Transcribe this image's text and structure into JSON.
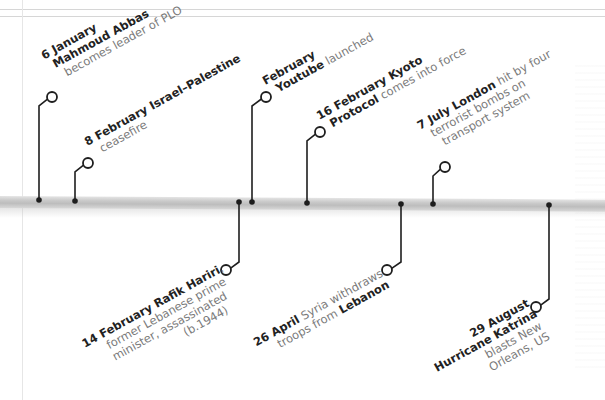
{
  "colors": {
    "pin": "#1e1e1e",
    "bold_text": "#222222",
    "light_text": "#7a7a7a",
    "bar": "#c4c4c4",
    "frame": "#d6d6d6"
  },
  "events_above": [
    {
      "id": "6-january",
      "date": "6 January",
      "lines": [
        {
          "bold": "6 January",
          "text": ""
        },
        {
          "bold": "Mahmoud Abbas",
          "text": ""
        },
        {
          "bold": "",
          "text": "becomes leader of PLO"
        }
      ],
      "dot": [
        39,
        200
      ],
      "elbow_y": 106,
      "circle": [
        52,
        97
      ]
    },
    {
      "id": "8-february",
      "date": "8 February",
      "lines": [
        {
          "bold": "8 February Israel–Palestine",
          "text": ""
        },
        {
          "bold": "",
          "text": "ceasefire"
        }
      ],
      "dot": [
        75,
        201
      ],
      "elbow_y": 172,
      "circle": [
        88,
        163
      ]
    },
    {
      "id": "february-youtube",
      "date": "February",
      "lines": [
        {
          "bold": "February",
          "text": ""
        },
        {
          "bold": "Youtube",
          "text": " launched"
        }
      ],
      "dot": [
        252,
        202
      ],
      "elbow_y": 106,
      "circle": [
        266,
        97
      ]
    },
    {
      "id": "16-february",
      "date": "16 February",
      "lines": [
        {
          "bold": "16 February Kyoto",
          "text": ""
        },
        {
          "bold": "Protocol",
          "text": " comes into force"
        }
      ],
      "dot": [
        307,
        203
      ],
      "elbow_y": 141,
      "circle": [
        320,
        132
      ]
    },
    {
      "id": "7-july",
      "date": "7 July",
      "lines": [
        {
          "bold": "7 July London",
          "text": " hit by four"
        },
        {
          "bold": "",
          "text": "terrorist bombs  on"
        },
        {
          "bold": "",
          "text": "transport system"
        }
      ],
      "dot": [
        433,
        204
      ],
      "elbow_y": 176,
      "circle": [
        445,
        167
      ]
    }
  ],
  "events_below": [
    {
      "id": "14-february",
      "date": "14 February",
      "lines": [
        {
          "bold": "14 February Rafik Hariri",
          "text": ","
        },
        {
          "bold": "",
          "text": "former Lebanese prime"
        },
        {
          "bold": "",
          "text": "minister, assassinated"
        },
        {
          "bold": "",
          "text": "(b.1944)"
        }
      ],
      "dot": [
        239,
        202
      ],
      "elbow_y": 262,
      "circle": [
        226,
        270
      ]
    },
    {
      "id": "26-april",
      "date": "26 April",
      "lines": [
        {
          "bold": "26 April",
          "text": " Syria withdraws"
        },
        {
          "bold": "",
          "text": "troops from ",
          "bold2": "Lebanon"
        }
      ],
      "dot": [
        401,
        204
      ],
      "elbow_y": 262,
      "circle": [
        387,
        270
      ]
    },
    {
      "id": "29-august",
      "date": "29 August",
      "lines": [
        {
          "bold": "29 August",
          "text": ""
        },
        {
          "bold": "Hurricane Katrina",
          "text": ""
        },
        {
          "bold": "",
          "text": "blasts New"
        },
        {
          "bold": "",
          "text": "Orleans, US"
        }
      ],
      "dot": [
        549,
        205
      ],
      "elbow_y": 299,
      "circle": [
        536,
        307
      ]
    }
  ]
}
